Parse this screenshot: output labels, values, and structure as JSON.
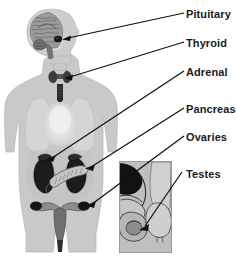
{
  "figure": {
    "background_color": "#ffffff",
    "body_color": "#c9c9c9",
    "body_outline_color": "#b0b0b0",
    "organ_dark_color": "#1e1e1e",
    "organ_mid_color": "#8a8a8a",
    "organ_light_color": "#dcdcdc",
    "leader_color": "#111111",
    "inset_border_color": "#9a9a9a",
    "inset_background_color": "#bdbdbd"
  },
  "labels": [
    {
      "id": "pituitary",
      "text": "Pituitary",
      "organ": "pituitary-gland",
      "location": "base of brain",
      "label_x": 186,
      "label_y": 8,
      "leader_start_x": 184,
      "leader_start_y": 13,
      "leader_end_x": 63,
      "leader_end_y": 39
    },
    {
      "id": "thyroid",
      "text": "Thyroid",
      "organ": "thyroid-gland",
      "location": "neck",
      "label_x": 186,
      "label_y": 37,
      "leader_start_x": 184,
      "leader_start_y": 42,
      "leader_end_x": 65,
      "leader_end_y": 78
    },
    {
      "id": "adrenal",
      "text": "Adrenal",
      "organ": "adrenal-gland",
      "location": "atop kidneys",
      "label_x": 186,
      "label_y": 66,
      "leader_start_x": 184,
      "leader_start_y": 71,
      "leader_end_x": 47,
      "leader_end_y": 159
    },
    {
      "id": "pancreas",
      "text": "Pancreas",
      "organ": "pancreas",
      "location": "upper abdomen",
      "label_x": 186,
      "label_y": 103,
      "leader_start_x": 184,
      "leader_start_y": 108,
      "leader_end_x": 86,
      "leader_end_y": 168
    },
    {
      "id": "ovaries",
      "text": "Ovaries",
      "organ": "ovary",
      "location": "pelvis",
      "label_x": 186,
      "label_y": 131,
      "leader_start_x": 184,
      "leader_start_y": 136,
      "leader_end_x": 87,
      "leader_end_y": 205
    },
    {
      "id": "testes",
      "text": "Testes",
      "organ": "testis",
      "location": "scrotum (inset)",
      "label_x": 186,
      "label_y": 168,
      "leader_start_x": 182,
      "leader_start_y": 172,
      "leader_end_x": 141,
      "leader_end_y": 229
    }
  ],
  "body_parts": [
    {
      "id": "head",
      "name": "head-profile"
    },
    {
      "id": "brain",
      "name": "brain-sagittal-section"
    },
    {
      "id": "neck",
      "name": "neck"
    },
    {
      "id": "torso",
      "name": "torso"
    },
    {
      "id": "arms",
      "name": "arms"
    },
    {
      "id": "legs",
      "name": "legs"
    },
    {
      "id": "lungs",
      "name": "lungs-heart-area"
    },
    {
      "id": "kidneys",
      "name": "kidneys"
    },
    {
      "id": "uterus",
      "name": "uterus"
    }
  ],
  "inset": {
    "name": "male-reproductive-inset",
    "x": 119,
    "y": 161,
    "width": 53,
    "height": 92,
    "parts": [
      "bladder",
      "prostate",
      "penis",
      "scrotum",
      "testis"
    ]
  }
}
